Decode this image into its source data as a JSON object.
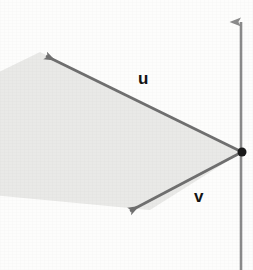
{
  "figure": {
    "type": "vector-plane-diagram",
    "background_color": "#fdfdfc",
    "description_labels": {
      "vector_u": "u",
      "vector_v": "v"
    },
    "axis": {
      "name": "vertical-axis",
      "color": "#8a8a8a",
      "x": 241,
      "top_y": 9,
      "bottom_y": 270,
      "arrow_at_top": true
    },
    "origin_point": {
      "name": "common-initial-point",
      "x": 242,
      "y": 152,
      "radius": 4.5,
      "color": "#1a1a1a"
    },
    "plane": {
      "name": "spanned-plane",
      "fill_color": "#e9e9e7",
      "points": "242,152 40,52 -60,101 -60,190 150,210"
    },
    "vectors": [
      {
        "name": "u",
        "label": "u",
        "color": "#6f6f6f",
        "from_x": 242,
        "from_y": 152,
        "to_x": 38,
        "to_y": 51,
        "label_x": 138,
        "label_y": 70
      },
      {
        "name": "v",
        "label": "v",
        "color": "#6f6f6f",
        "from_x": 242,
        "from_y": 152,
        "to_x": 122,
        "to_y": 216,
        "label_x": 194,
        "label_y": 188
      }
    ]
  }
}
